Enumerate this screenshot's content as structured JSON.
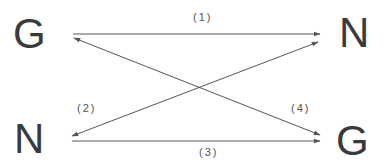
{
  "diagram": {
    "type": "reaction-scheme",
    "nodes": {
      "top_left": "G",
      "top_right": "N",
      "bottom_left": "N",
      "bottom_right": "G"
    },
    "edges": [
      {
        "id": "1",
        "label": "(1)",
        "from": "top_left G",
        "to": "top_right N",
        "direction": "forward"
      },
      {
        "id": "2",
        "label": "(2)",
        "from": "top_right N",
        "to": "bottom_left N",
        "direction": "bidirectional-diagonal"
      },
      {
        "id": "3",
        "label": "(3)",
        "from": "bottom_left N",
        "to": "bottom_right G",
        "direction": "forward"
      },
      {
        "id": "4",
        "label": "(4)",
        "from": "top_left G",
        "to": "bottom_right G",
        "direction": "bidirectional-diagonal"
      }
    ],
    "colors": {
      "text": "#3a3a3a",
      "line": "#555555",
      "background": "#ffffff"
    }
  }
}
